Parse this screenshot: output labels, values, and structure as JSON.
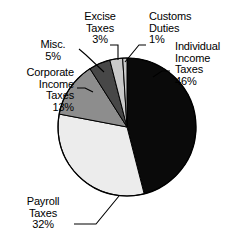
{
  "chart_data": {
    "type": "pie",
    "title": "",
    "subtitle": "",
    "xlabel": "",
    "ylabel": "",
    "legend_position": "none",
    "grid": false,
    "start_angle_deg": 0,
    "direction": "clockwise",
    "categories": [
      "Individual Income Taxes",
      "Payroll Taxes",
      "Corporate Income Taxes",
      "Misc.",
      "Excise Taxes",
      "Customs Duties"
    ],
    "values": [
      46,
      32,
      13,
      5,
      3,
      1
    ],
    "unit": "%",
    "slices": [
      {
        "name": "Individual Income Taxes",
        "value": 46,
        "value_text": "46%",
        "color": "#0a0a0a",
        "label_lines": [
          "Individual",
          "Income",
          "Taxes",
          "46%"
        ]
      },
      {
        "name": "Payroll Taxes",
        "value": 32,
        "value_text": "32%",
        "color": "#ececec",
        "label_lines": [
          "Payroll",
          "Taxes",
          "32%"
        ]
      },
      {
        "name": "Corporate Income Taxes",
        "value": 13,
        "value_text": "13%",
        "color": "#8d8d8d",
        "label_lines": [
          "Corporate",
          "Income",
          "Taxes",
          "13%"
        ]
      },
      {
        "name": "Misc.",
        "value": 5,
        "value_text": "5%",
        "color": "#474747",
        "label_lines": [
          "Misc.",
          "5%"
        ]
      },
      {
        "name": "Excise Taxes",
        "value": 3,
        "value_text": "3%",
        "color": "#c9c9c9",
        "label_lines": [
          "Excise",
          "Taxes",
          "3%"
        ]
      },
      {
        "name": "Customs Duties",
        "value": 1,
        "value_text": "1%",
        "color": "#c9c9c9",
        "label_lines": [
          "Customs",
          "Duties",
          "1%"
        ]
      }
    ],
    "colors": {
      "individual_income_taxes": "#0a0a0a",
      "payroll_taxes": "#ececec",
      "corporate_income_taxes": "#8d8d8d",
      "misc": "#474747",
      "excise_taxes": "#c9c9c9",
      "customs_duties": "#c9c9c9",
      "outline": "#000000",
      "background": "#ffffff",
      "text": "#000000"
    }
  },
  "labels": {
    "individual": {
      "l1": "Individual",
      "l2": "Income",
      "l3": "Taxes",
      "l4": "46%"
    },
    "payroll": {
      "l1": "Payroll",
      "l2": "Taxes",
      "l3": "32%"
    },
    "corporate": {
      "l1": "Corporate",
      "l2": "Income",
      "l3": "Taxes",
      "l4": "13%"
    },
    "misc": {
      "l1": "Misc.",
      "l2": "5%"
    },
    "excise": {
      "l1": "Excise",
      "l2": "Taxes",
      "l3": "3%"
    },
    "customs": {
      "l1": "Customs",
      "l2": "Duties",
      "l3": "1%"
    }
  }
}
